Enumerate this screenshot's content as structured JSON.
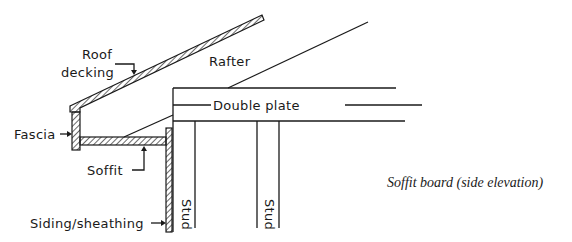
{
  "diagram": {
    "caption": "Soffit board (side elevation)",
    "labels": {
      "roof_decking_line1": "Roof",
      "roof_decking_line2": "decking",
      "rafter": "Rafter",
      "double_plate": "Double plate",
      "fascia": "Fascia",
      "soffit": "Soffit",
      "stud_1": "Stud",
      "stud_2": "Stud",
      "siding_sheathing": "Siding/sheathing"
    },
    "colors": {
      "line": "#1a1a1a",
      "background": "#ffffff"
    }
  }
}
